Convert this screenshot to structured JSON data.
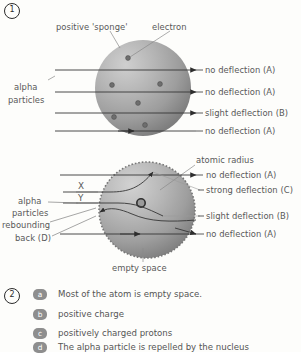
{
  "page": {
    "background_color": "#fdfdfb",
    "text_color": "#585858"
  },
  "question_1": {
    "number": "1",
    "diagram_a": {
      "name": "plum-pudding-model",
      "labels": {
        "positive_sponge": "positive 'sponge'",
        "electron": "electron",
        "alpha_line1": "alpha",
        "alpha_line2": "particles"
      },
      "outcomes": [
        "no deflection (A)",
        "no deflection (A)",
        "slight deflection (B)",
        "no deflection (A)"
      ]
    },
    "diagram_b": {
      "name": "nuclear-model",
      "labels": {
        "atomic_radius": "atomic radius",
        "alpha_line1": "alpha",
        "alpha_line2": "particles",
        "rebounding_line1": "rebounding",
        "rebounding_line2": "back (D)",
        "empty_space": "empty space",
        "ray_x": "X",
        "ray_y": "Y"
      },
      "outcomes": [
        "no deflection (A)",
        "strong deflection (C)",
        "slight deflection (B)",
        "no deflection (A)"
      ]
    }
  },
  "question_2": {
    "number": "2",
    "answers": [
      {
        "key": "a",
        "text": "Most of the atom is empty space."
      },
      {
        "key": "b",
        "text": "positive charge"
      },
      {
        "key": "c",
        "text": "positively charged protons"
      },
      {
        "key": "d",
        "text": "The alpha particle is repelled by the nucleus"
      }
    ]
  }
}
